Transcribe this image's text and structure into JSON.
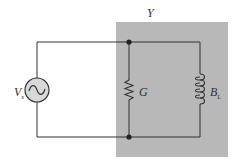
{
  "diagram": {
    "type": "circuit",
    "region_label": "Y",
    "source": {
      "label": "V",
      "subscript": "s",
      "kind": "AC voltage source"
    },
    "components": [
      {
        "label": "G",
        "kind": "conductance (resistor)"
      },
      {
        "label": "B",
        "subscript": "L",
        "kind": "inductive susceptance (inductor)"
      }
    ],
    "colors": {
      "region_fill": "#b8b8b8",
      "wire": "#333333",
      "source_fill": "#d8d8d8"
    }
  }
}
